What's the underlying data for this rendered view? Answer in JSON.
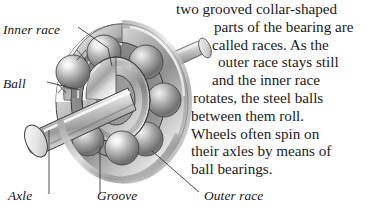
{
  "figure": {
    "background_color": "#ffffff",
    "ink_color": "#1b1b1b",
    "leader_line_color": "#3a3a3a"
  },
  "callouts": [
    {
      "key": "inner_race",
      "label": "Inner race"
    },
    {
      "key": "ball",
      "label": "Ball"
    },
    {
      "key": "axle",
      "label": "Axle"
    },
    {
      "key": "groove",
      "label": "Groove"
    },
    {
      "key": "outer_race",
      "label": "Outer race"
    }
  ],
  "body_text": {
    "full": "two grooved collar-shaped parts of the bearing are called races. As the outer race stays still and the inner race rotates, the steel balls between them roll. Wheels often spin on their axles by means of ball bearings.",
    "lines": [
      {
        "text": "two grooved collar-shaped",
        "indent": 2
      },
      {
        "text": "parts of the bearing are",
        "indent": 40
      },
      {
        "text": "called races. As the",
        "indent": 38
      },
      {
        "text": "outer race stays still",
        "indent": 44
      },
      {
        "text": "and the inner race",
        "indent": 38
      },
      {
        "text": "rotates, the steel balls",
        "indent": 19
      },
      {
        "text": "between them roll.",
        "indent": 17
      },
      {
        "text": "Wheels often spin on",
        "indent": 17
      },
      {
        "text": "their axles by means of",
        "indent": 17
      },
      {
        "text": "ball bearings.",
        "indent": 17
      }
    ]
  }
}
